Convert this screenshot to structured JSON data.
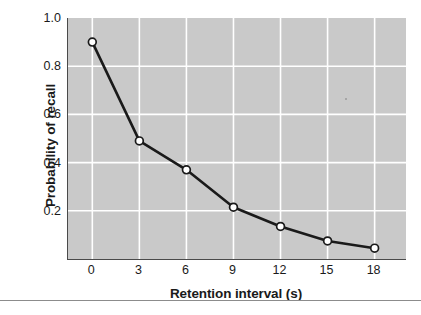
{
  "chart_data": {
    "type": "line",
    "title": "",
    "subtitle": "",
    "xlabel": "Retention interval (s)",
    "ylabel": "Probability of recall",
    "x": [
      0,
      3,
      6,
      9,
      12,
      15,
      18
    ],
    "values": [
      0.9,
      0.49,
      0.37,
      0.215,
      0.135,
      0.075,
      0.045
    ],
    "series": [
      {
        "name": "Probability of recall",
        "values": [
          0.9,
          0.49,
          0.37,
          0.215,
          0.135,
          0.075,
          0.045
        ]
      }
    ],
    "xlim": [
      -1.55,
      20.0
    ],
    "ylim": [
      0.0,
      1.0
    ],
    "x_tick_labels": [
      "0",
      "3",
      "6",
      "9",
      "12",
      "15",
      "18"
    ],
    "x_tick_values": [
      0,
      3,
      6,
      9,
      12,
      15,
      18
    ],
    "y_tick_labels": [
      "0.2",
      "0.4",
      "0.6",
      "0.8",
      "1.0"
    ],
    "y_tick_values": [
      0.2,
      0.4,
      0.6,
      0.8,
      1.0
    ],
    "grid": true,
    "grid_color": "#ffffff",
    "legend": false,
    "legend_position": "none",
    "panel_color": "#c9c9c9",
    "line_color": "#1a1a1a",
    "marker": "open-circle",
    "marker_face_color": "#ffffff",
    "marker_edge_color": "#1a1a1a",
    "axis_color": "#4a4a4a"
  }
}
